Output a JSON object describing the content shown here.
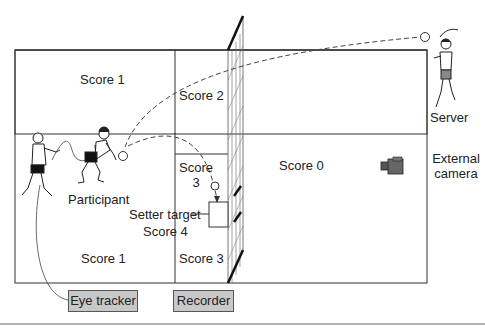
{
  "diagram": {
    "court_zones": {
      "left_back_top": "Score 1",
      "left_back_bottom": "Score 1",
      "mid_top": "Score 2",
      "mid_center_line1": "Score",
      "mid_center_line2": "3",
      "mid_bottom": "Score 3",
      "setter_target": "Setter target",
      "setter_target_score": "Score 4",
      "opponent_side": "Score 0"
    },
    "actors": {
      "participant": "Participant",
      "server": "Server",
      "external_camera_line1": "External",
      "external_camera_line2": "camera"
    },
    "devices": {
      "eye_tracker": "Eye tracker",
      "recorder": "Recorder"
    },
    "colors": {
      "line": "#333333",
      "device_box_fill": "#c8c8c8",
      "net": "#222222"
    }
  }
}
